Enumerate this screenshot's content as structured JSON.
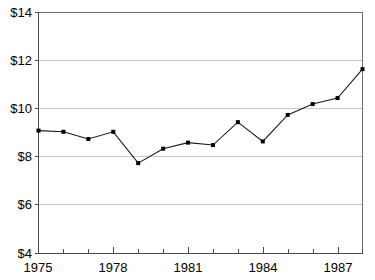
{
  "chart_data": {
    "type": "line",
    "title": "",
    "subtitle": "",
    "xlabel": "",
    "ylabel": "",
    "x": [
      1975,
      1976,
      1977,
      1978,
      1979,
      1980,
      1981,
      1982,
      1983,
      1984,
      1985,
      1986,
      1987,
      1988
    ],
    "values": [
      9.1,
      9.05,
      8.75,
      9.05,
      7.75,
      8.35,
      8.6,
      8.5,
      9.45,
      8.65,
      9.75,
      10.2,
      10.45,
      11.65
    ],
    "series": [
      {
        "name": "price",
        "values": [
          9.1,
          9.05,
          8.75,
          9.05,
          7.75,
          8.35,
          8.6,
          8.5,
          9.45,
          8.65,
          9.75,
          10.2,
          10.45,
          11.65
        ]
      }
    ],
    "xlim": [
      1975,
      1988
    ],
    "ylim": [
      4,
      14
    ],
    "grid": true,
    "legend": "none",
    "markers": true,
    "line_color": "#1a1a1a",
    "marker_color": "#000000",
    "grid_color": "#c8c8c8",
    "axis_color": "#4a4a4a"
  },
  "yaxis": {
    "ticks": [
      {
        "value": 14,
        "label": "$14"
      },
      {
        "value": 12,
        "label": "$12"
      },
      {
        "value": 10,
        "label": "$10"
      },
      {
        "value": 8,
        "label": "$8"
      },
      {
        "value": 6,
        "label": "$6"
      },
      {
        "value": 4,
        "label": "$4"
      }
    ]
  },
  "xaxis": {
    "major_ticks": [
      {
        "value": 1975,
        "label": "1975"
      },
      {
        "value": 1978,
        "label": "1978"
      },
      {
        "value": 1981,
        "label": "1981"
      },
      {
        "value": 1984,
        "label": "1984"
      },
      {
        "value": 1987,
        "label": "1987"
      }
    ],
    "minor_ticks": [
      1976,
      1977,
      1979,
      1980,
      1982,
      1983,
      1985,
      1986,
      1988
    ]
  }
}
